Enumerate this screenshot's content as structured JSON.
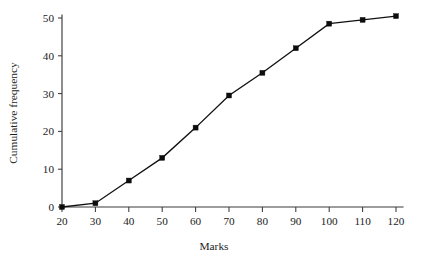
{
  "chart_data": {
    "type": "line",
    "title": "",
    "xlabel": "Marks",
    "ylabel": "Cumulative frequency",
    "x": [
      20,
      30,
      40,
      50,
      60,
      70,
      80,
      90,
      100,
      110,
      120
    ],
    "values": [
      0,
      1,
      7,
      13,
      21,
      29.5,
      35.5,
      42,
      48.5,
      49.5,
      50.5
    ],
    "series": [
      {
        "name": "Cumulative frequency",
        "values": [
          0,
          1,
          7,
          13,
          21,
          29.5,
          35.5,
          42,
          48.5,
          49.5,
          50.5
        ]
      }
    ],
    "xlim": [
      20,
      120
    ],
    "ylim": [
      0,
      52
    ],
    "xticks": [
      20,
      30,
      40,
      50,
      60,
      70,
      80,
      90,
      100,
      110,
      120
    ],
    "yticks": [
      0,
      10,
      20,
      30,
      40,
      50
    ],
    "xtick_labels": [
      "20",
      "30",
      "40",
      "50",
      "60",
      "70",
      "80",
      "90",
      "100",
      "110",
      "120"
    ],
    "ytick_labels": [
      "0",
      "10",
      "20",
      "30",
      "40",
      "50"
    ],
    "grid": false,
    "legend": false,
    "legend_position": "none",
    "marker": "filled-square",
    "line_color": "#111111",
    "marker_color": "#0d0d0d",
    "axis_color": "#3a3a3a",
    "background_color": "#ffffff"
  }
}
